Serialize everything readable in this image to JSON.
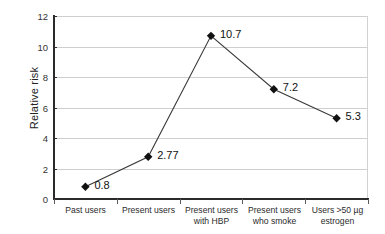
{
  "chart_data": {
    "type": "line",
    "title": "",
    "xlabel": "",
    "ylabel": "Relative risk",
    "ylim": [
      0,
      12
    ],
    "yticks": [
      0,
      2,
      4,
      6,
      8,
      10,
      12
    ],
    "grid": true,
    "legend": "none",
    "marker": "diamond",
    "categories": [
      "Past users",
      "Present users",
      "Present users with HBP",
      "Present users who smoke",
      "Users >50 µg estrogen"
    ],
    "category_lines": [
      [
        "Past users",
        ""
      ],
      [
        "Present users",
        ""
      ],
      [
        "Present users",
        "with HBP"
      ],
      [
        "Present users",
        "who smoke"
      ],
      [
        "Users >50 µg",
        "estrogen"
      ]
    ],
    "values": [
      0.8,
      2.77,
      10.7,
      7.2,
      5.3
    ],
    "point_labels": [
      "0.8",
      "2.77",
      "10.7",
      "7.2",
      "5.3"
    ],
    "colors": {
      "line": "#3a3a3a",
      "marker": "#111111",
      "gridline": "#cfcfcf",
      "axis": "#2b2b2b",
      "text": "#1a1a1a",
      "background": "#ffffff"
    }
  },
  "axis": {
    "y_title": "Relative risk",
    "y_tick_labels": [
      "12",
      "10",
      "8",
      "6",
      "4",
      "2",
      "0"
    ]
  }
}
